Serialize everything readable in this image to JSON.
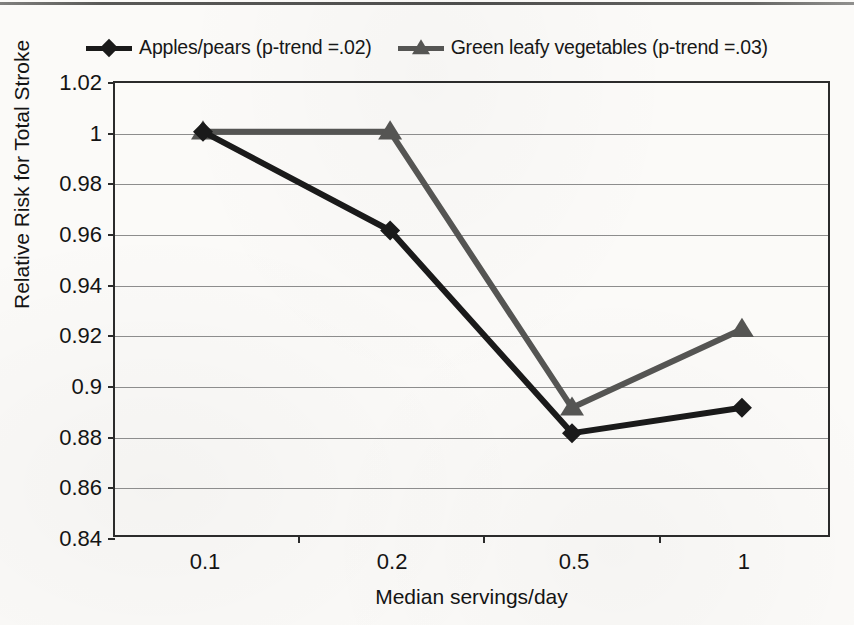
{
  "chart_data": {
    "type": "line",
    "title": "",
    "xlabel": "Median servings/day",
    "ylabel": "Relative Risk for  Total Stroke",
    "categories": [
      "0.1",
      "0.2",
      "0.5",
      "1"
    ],
    "x_positions": [
      0.1,
      0.2,
      0.5,
      1
    ],
    "ylim": [
      0.84,
      1.02
    ],
    "yticks": [
      "1.02",
      "1",
      "0.98",
      "0.96",
      "0.94",
      "0.92",
      "0.9",
      "0.88",
      "0.86",
      "0.84"
    ],
    "ytick_values": [
      1.02,
      1.0,
      0.98,
      0.96,
      0.94,
      0.92,
      0.9,
      0.88,
      0.86,
      0.84
    ],
    "grid": true,
    "legend_position": "top-center",
    "series": [
      {
        "name": "Apples/pears (p-trend =.02)",
        "marker": "diamond",
        "color": "#1a1a1a",
        "values": [
          1.0,
          0.961,
          0.881,
          0.891
        ]
      },
      {
        "name": "Green leafy vegetables (p-trend =.03)",
        "marker": "triangle",
        "color": "#555553",
        "values": [
          1.0,
          1.0,
          0.891,
          0.922
        ]
      }
    ]
  },
  "legend": {
    "entries": [
      {
        "label": "Apples/pears (p-trend =.02)",
        "marker": "diamond-marker",
        "color": "#1a1a1a"
      },
      {
        "label": "Green leafy vegetables (p-trend =.03)",
        "marker": "triangle-marker",
        "color": "#555553"
      }
    ]
  },
  "axes": {
    "y_title": "Relative Risk for  Total Stroke",
    "x_title": "Median servings/day"
  },
  "colors": {
    "apples_series": "#1a1a1a",
    "green_leafy_series": "#555553",
    "gridline": "#8d8d8d",
    "axis": "#2b2b2b",
    "background": "#fbfaf8"
  }
}
